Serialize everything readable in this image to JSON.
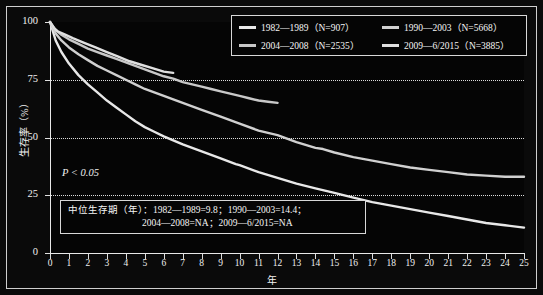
{
  "chart_data": {
    "type": "line",
    "title": "",
    "xlabel": "年",
    "ylabel": "生存率（%）",
    "xlim": [
      0,
      25
    ],
    "ylim": [
      0,
      100
    ],
    "xticks": [
      0,
      1,
      2,
      3,
      4,
      5,
      6,
      7,
      8,
      9,
      10,
      11,
      12,
      13,
      14,
      15,
      16,
      17,
      18,
      19,
      20,
      21,
      22,
      23,
      24,
      25
    ],
    "yticks": [
      0,
      25,
      50,
      75,
      100
    ],
    "grid": "horizontal-dotted at 25, 50, 75",
    "legend_position": "top-right",
    "annotations": [
      "P < 0.05",
      "中位生存期（年）：1982—1989=9.8；1990—2003=14.4；",
      "2004—2008=NA；2009—6/2015=NA"
    ],
    "series": [
      {
        "name": "1982—1989",
        "n": 907,
        "label": "1982—1989（N=907）",
        "color": "#e8e8e8",
        "median_survival_years": 9.8,
        "points": [
          [
            0,
            100
          ],
          [
            0.3,
            92
          ],
          [
            0.6,
            87
          ],
          [
            1,
            82
          ],
          [
            1.5,
            77
          ],
          [
            2,
            73
          ],
          [
            2.5,
            69.5
          ],
          [
            3,
            66
          ],
          [
            3.5,
            63
          ],
          [
            4,
            60
          ],
          [
            4.5,
            57
          ],
          [
            5,
            54.5
          ],
          [
            5.5,
            52.5
          ],
          [
            6,
            50.5
          ],
          [
            7,
            47
          ],
          [
            8,
            44
          ],
          [
            9,
            41
          ],
          [
            9.8,
            38.5
          ],
          [
            10,
            38
          ],
          [
            11,
            35
          ],
          [
            12,
            32.5
          ],
          [
            13,
            30
          ],
          [
            14,
            28
          ],
          [
            15,
            26
          ],
          [
            16,
            24
          ],
          [
            17,
            22
          ],
          [
            18,
            20.5
          ],
          [
            19,
            19
          ],
          [
            20,
            17.5
          ],
          [
            21,
            16
          ],
          [
            22,
            14.5
          ],
          [
            23,
            13
          ],
          [
            24,
            12
          ],
          [
            25,
            11
          ]
        ]
      },
      {
        "name": "1990—2003",
        "n": 5668,
        "label": "1990—2003（N=5668）",
        "color": "#d0d0d0",
        "median_survival_years": 14.4,
        "points": [
          [
            0,
            100
          ],
          [
            0.3,
            95
          ],
          [
            0.6,
            92
          ],
          [
            1,
            89
          ],
          [
            1.5,
            86
          ],
          [
            2,
            83.5
          ],
          [
            2.5,
            81
          ],
          [
            3,
            79
          ],
          [
            3.5,
            77
          ],
          [
            4,
            75
          ],
          [
            4.5,
            73
          ],
          [
            5,
            71
          ],
          [
            5.5,
            69.5
          ],
          [
            6,
            68
          ],
          [
            7,
            65
          ],
          [
            8,
            62
          ],
          [
            9,
            59
          ],
          [
            10,
            56
          ],
          [
            11,
            53
          ],
          [
            12,
            51
          ],
          [
            13,
            48
          ],
          [
            14,
            45.5
          ],
          [
            14.4,
            45
          ],
          [
            15,
            43.5
          ],
          [
            16,
            41.5
          ],
          [
            17,
            40
          ],
          [
            18,
            38.5
          ],
          [
            19,
            37
          ],
          [
            20,
            36
          ],
          [
            21,
            35
          ],
          [
            22,
            34
          ],
          [
            23,
            33.5
          ],
          [
            24,
            33
          ],
          [
            25,
            33
          ]
        ]
      },
      {
        "name": "2004—2008",
        "n": 2535,
        "label": "2004—2008（N=2535）",
        "color": "#c8c8c8",
        "median_survival_years": "NA",
        "points": [
          [
            0,
            100
          ],
          [
            0.3,
            96.5
          ],
          [
            0.6,
            94.5
          ],
          [
            1,
            92.5
          ],
          [
            1.5,
            90.5
          ],
          [
            2,
            88.5
          ],
          [
            2.5,
            87
          ],
          [
            3,
            85.5
          ],
          [
            3.5,
            84
          ],
          [
            4,
            82.5
          ],
          [
            4.5,
            81
          ],
          [
            5,
            79.5
          ],
          [
            5.5,
            78
          ],
          [
            6,
            76.5
          ],
          [
            6.5,
            75.5
          ],
          [
            7,
            74
          ],
          [
            7.5,
            73
          ],
          [
            8,
            72
          ],
          [
            8.5,
            71
          ],
          [
            9,
            70
          ],
          [
            9.5,
            69
          ],
          [
            10,
            68
          ],
          [
            10.5,
            67
          ],
          [
            11,
            66
          ],
          [
            11.5,
            65.5
          ],
          [
            12,
            65
          ]
        ]
      },
      {
        "name": "2009—6/2015",
        "n": 3885,
        "label": "2009—6/2015（N=3885）",
        "color": "#e0e0e0",
        "median_survival_years": "NA",
        "points": [
          [
            0,
            100
          ],
          [
            0.2,
            97.5
          ],
          [
            0.4,
            96
          ],
          [
            0.8,
            94.5
          ],
          [
            1.2,
            93
          ],
          [
            1.8,
            91
          ],
          [
            2.4,
            89
          ],
          [
            3,
            87
          ],
          [
            3.6,
            85
          ],
          [
            4.2,
            83
          ],
          [
            4.8,
            81.5
          ],
          [
            5.4,
            80
          ],
          [
            6,
            78.5
          ],
          [
            6.5,
            78
          ]
        ]
      }
    ]
  },
  "legend": {
    "entries": [
      {
        "label": "1982—1989（N=907）",
        "color": "#e8e8e8"
      },
      {
        "label": "1990—2003（N=5668）",
        "color": "#d0d0d0"
      },
      {
        "label": "2004—2008（N=2535）",
        "color": "#c8c8c8"
      },
      {
        "label": "2009—6/2015（N=3885）",
        "color": "#e0e0e0"
      }
    ]
  },
  "axes": {
    "y_title": "生存率（%）",
    "x_title": "年",
    "y_ticks": [
      "0",
      "25",
      "50",
      "75",
      "100"
    ],
    "x_ticks": [
      "0",
      "1",
      "2",
      "3",
      "4",
      "5",
      "6",
      "7",
      "8",
      "9",
      "10",
      "11",
      "12",
      "13",
      "14",
      "15",
      "16",
      "17",
      "18",
      "19",
      "20",
      "21",
      "22",
      "23",
      "24",
      "25"
    ]
  },
  "annotations": {
    "p_value": "P < 0.05",
    "median_line_1": "中位生存期（年）：1982—1989=9.8；1990—2003=14.4；",
    "median_line_2": "2004—2008=NA；2009—6/2015=NA"
  }
}
